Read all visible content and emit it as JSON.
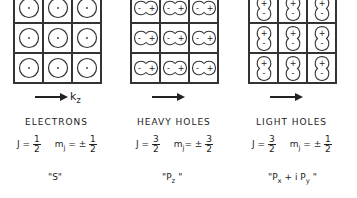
{
  "panels": [
    {
      "id": "electrons",
      "title": "ELECTRONS",
      "orbital_shape": "s-circle",
      "cell_symbol": "·",
      "arrow_label": "k",
      "arrow_label_sub": "z",
      "J_label": "J =",
      "J_num": "1",
      "J_den": "2",
      "mj_label": "m",
      "mj_sub": "j",
      "mj_eq": "= ±",
      "mj_num": "1",
      "mj_den": "2",
      "orbital_quote_open": "\"",
      "orbital_main": "S",
      "orbital_sub": "",
      "orbital_rest": "",
      "orbital_rest_sub": "",
      "orbital_quote_close": "\""
    },
    {
      "id": "heavy-holes",
      "title": "HEAVY HOLES",
      "orbital_shape": "p-horizontal",
      "cell_minus": "-",
      "cell_plus": "+",
      "J_label": "J =",
      "J_num": "3",
      "J_den": "2",
      "mj_label": "m",
      "mj_sub": "j",
      "mj_eq": "= ±",
      "mj_num": "3",
      "mj_den": "2",
      "orbital_quote_open": "\"",
      "orbital_main": "P",
      "orbital_sub": "z",
      "orbital_rest": "",
      "orbital_rest_sub": "",
      "orbital_quote_close": " \""
    },
    {
      "id": "light-holes",
      "title": "LIGHT HOLES",
      "orbital_shape": "p-vertical",
      "cell_minus": "-",
      "cell_plus": "+",
      "J_label": "J =",
      "J_num": "3",
      "J_den": "2",
      "mj_label": "m",
      "mj_sub": "j",
      "mj_eq": "= ±",
      "mj_num": "1",
      "mj_den": "2",
      "orbital_quote_open": "\"",
      "orbital_main": "P",
      "orbital_sub": "x",
      "orbital_rest": " + i P",
      "orbital_rest_sub": "y",
      "orbital_quote_close": " \""
    }
  ]
}
